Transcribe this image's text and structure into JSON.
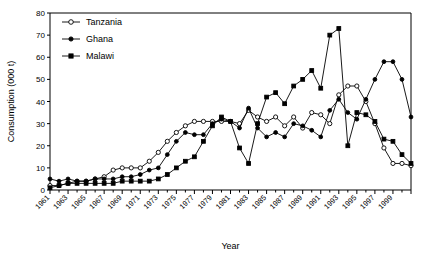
{
  "chart_data": {
    "type": "line",
    "title": "",
    "xlabel": "Year",
    "ylabel": "Consumption (000 t)",
    "xlim": [
      1961,
      2001
    ],
    "ylim": [
      0,
      80
    ],
    "ytick_step": 10,
    "yticks": [
      0,
      10,
      20,
      30,
      40,
      50,
      60,
      70,
      80
    ],
    "xtick_labels": [
      "1961",
      "1963",
      "1965",
      "1967",
      "1969",
      "1971",
      "1973",
      "1975",
      "1977",
      "1979",
      "1981",
      "1983",
      "1985",
      "1987",
      "1989",
      "1991",
      "1993",
      "1995",
      "1997",
      "1999"
    ],
    "xtick_step": 2,
    "grid": false,
    "legend_position": "top-left",
    "x": [
      1961,
      1962,
      1963,
      1964,
      1965,
      1966,
      1967,
      1968,
      1969,
      1970,
      1971,
      1972,
      1973,
      1974,
      1975,
      1976,
      1977,
      1978,
      1979,
      1980,
      1981,
      1982,
      1983,
      1984,
      1985,
      1986,
      1987,
      1988,
      1989,
      1990,
      1991,
      1992,
      1993,
      1994,
      1995,
      1996,
      1997,
      1998,
      1999,
      2000,
      2001
    ],
    "series": [
      {
        "name": "Tanzania",
        "marker": "open-circle",
        "values": [
          2,
          2,
          3,
          4,
          4,
          5,
          6,
          9,
          10,
          10,
          10,
          13,
          17,
          22,
          26,
          29,
          31,
          31,
          31,
          31,
          31,
          30,
          36,
          33,
          31,
          33,
          29,
          33,
          28,
          35,
          34,
          30,
          43,
          47,
          47,
          40,
          30,
          19,
          12,
          12,
          11
        ]
      },
      {
        "name": "Ghana",
        "marker": "filled-circle",
        "values": [
          5,
          4,
          5,
          4,
          4,
          5,
          5,
          5,
          6,
          6,
          7,
          9,
          10,
          16,
          22,
          26,
          25,
          25,
          30,
          32,
          31,
          28,
          37,
          28,
          24,
          26,
          24,
          30,
          29,
          27,
          24,
          36,
          41,
          35,
          32,
          41,
          50,
          58,
          58,
          50,
          33
        ]
      },
      {
        "name": "Malawi",
        "marker": "filled-square",
        "values": [
          1,
          2,
          3,
          3,
          3,
          3,
          3,
          3,
          4,
          4,
          4,
          4,
          5,
          7,
          10,
          13,
          15,
          22,
          29,
          33,
          31,
          19,
          12,
          30,
          42,
          44,
          39,
          47,
          50,
          54,
          46,
          70,
          73,
          20,
          35,
          34,
          31,
          23,
          22,
          16,
          12
        ]
      }
    ]
  },
  "legend": {
    "items": [
      {
        "label": "Tanzania"
      },
      {
        "label": "Ghana"
      },
      {
        "label": "Malawi"
      }
    ]
  },
  "axes": {
    "y_title": "Consumption (000 t)",
    "x_title": "Year"
  }
}
